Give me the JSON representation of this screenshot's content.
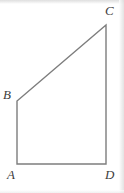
{
  "figure": {
    "shape_type": "quadrilateral",
    "stroke_color": "#7d7d7d",
    "stroke_width": 1.4,
    "label_color": "#3d3d3d",
    "background_color": "#ffffff",
    "canvas": {
      "width": 124,
      "height": 193
    },
    "vertices": [
      {
        "id": "A",
        "label": "A",
        "x": 17,
        "y": 164
      },
      {
        "id": "B",
        "label": "B",
        "x": 17,
        "y": 101
      },
      {
        "id": "C",
        "label": "C",
        "x": 106,
        "y": 25
      },
      {
        "id": "D",
        "label": "D",
        "x": 106,
        "y": 164
      }
    ],
    "edges": [
      {
        "id": "AB",
        "from": "A",
        "to": "B",
        "name": "left-side"
      },
      {
        "id": "BC",
        "from": "B",
        "to": "C",
        "name": "diagonal-side"
      },
      {
        "id": "CD",
        "from": "C",
        "to": "D",
        "name": "right-side"
      },
      {
        "id": "DA",
        "from": "D",
        "to": "A",
        "name": "bottom-side"
      }
    ],
    "path_points": "17,164 17,101 106,25 106,164 17,164"
  }
}
